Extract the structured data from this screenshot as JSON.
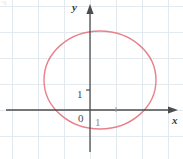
{
  "figure": {
    "width": 183,
    "height": 159,
    "background": "#ffffff",
    "corner_mark": "◹"
  },
  "axes": {
    "x_axis_label": "x",
    "y_axis_label": "y",
    "origin_label": "0",
    "x_tick_label": "1",
    "y_tick_label": "1",
    "axis_color": "#4d4d4d",
    "grid_color": "#e3eaef",
    "origin_px": {
      "x": 90,
      "y": 110
    },
    "unit_px": 26
  },
  "chart_data": {
    "type": "line",
    "title": "",
    "xlabel": "x",
    "ylabel": "y",
    "grid": true,
    "legend": null,
    "xlim": [
      -3.5,
      3.6
    ],
    "ylim": [
      -1.9,
      4.2
    ],
    "xticks": [
      0,
      1
    ],
    "xticklabels": [
      "0",
      "1"
    ],
    "yticks": [
      1
    ],
    "yticklabels": [
      "1"
    ],
    "series": [
      {
        "name": "ellipse",
        "kind": "ellipse",
        "color": "#e8818a",
        "linewidth": 1.4,
        "fill": "none",
        "center": [
          0.385,
          1.15
        ],
        "radii": [
          2.15,
          1.885
        ],
        "center_px": [
          100,
          80
        ],
        "radii_px": [
          56,
          49
        ],
        "bounds_px": {
          "left": 44,
          "right": 156,
          "top": 31,
          "bottom": 129
        },
        "equation_hint": "closed oval curve crossing the x-axis near x = -1.7 and x = 2.5"
      }
    ]
  }
}
